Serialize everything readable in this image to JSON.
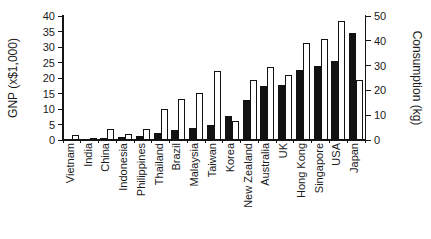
{
  "figure": {
    "title": "",
    "background": "#ffffff",
    "text_color": "#1a1a1a"
  },
  "chart_data": {
    "type": "bar",
    "dual_axis": true,
    "grid": false,
    "legend": "none",
    "categories": [
      "Vietnam",
      "India",
      "China",
      "Indonesia",
      "Philippines",
      "Thailand",
      "Brazil",
      "Malaysia",
      "Taiwan",
      "Korea",
      "New Zealand",
      "Australia",
      "UK",
      "Hong Kong",
      "Singapore",
      "USA",
      "Japan"
    ],
    "series": [
      {
        "name": "GNP",
        "axis": "left",
        "bar_style": "solid-black",
        "color": "#121212",
        "values": [
          0.2,
          0.2,
          0.7,
          0.9,
          1.2,
          2.2,
          3.2,
          3.8,
          4.8,
          7.8,
          12.8,
          17.3,
          17.9,
          22.7,
          23.8,
          25.5,
          34.5
        ]
      },
      {
        "name": "Consumption",
        "axis": "right",
        "bar_style": "white-outlined",
        "color": "#ffffff",
        "outline": "#121212",
        "values": [
          2.2,
          0.3,
          4.3,
          2.3,
          4.6,
          12.6,
          16.5,
          19.0,
          28.0,
          7.5,
          24.3,
          29.5,
          26.1,
          39.2,
          40.7,
          48.0,
          24.0
        ]
      }
    ],
    "left_axis": {
      "label": "GNP (x$1,000)",
      "min": 0,
      "max": 40,
      "ticks": [
        0,
        5,
        10,
        15,
        20,
        25,
        30,
        35,
        40
      ]
    },
    "right_axis": {
      "label": "Consumption (kg)",
      "min": 0,
      "max": 50,
      "ticks": [
        0,
        10,
        20,
        30,
        40,
        50
      ]
    }
  }
}
